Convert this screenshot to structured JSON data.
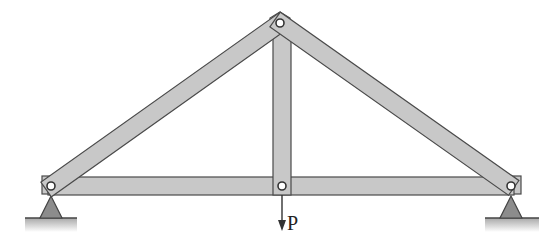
{
  "diagram": {
    "type": "truss",
    "colors": {
      "member_fill": "#c8c8c8",
      "member_stroke": "#4a4a4a",
      "support_fill": "#8c8c8c",
      "ground": "#bdbdbd"
    },
    "joints": [
      {
        "id": "left-support-joint",
        "x": 51,
        "y": 186
      },
      {
        "id": "apex-joint",
        "x": 280,
        "y": 23
      },
      {
        "id": "bottom-center-joint",
        "x": 282,
        "y": 186
      },
      {
        "id": "right-support-joint",
        "x": 511,
        "y": 186
      }
    ],
    "members": [
      {
        "id": "bottom-chord",
        "from": "left-support-joint",
        "to": "right-support-joint"
      },
      {
        "id": "left-rafter",
        "from": "left-support-joint",
        "to": "apex-joint"
      },
      {
        "id": "right-rafter",
        "from": "apex-joint",
        "to": "right-support-joint"
      },
      {
        "id": "king-post",
        "from": "apex-joint",
        "to": "bottom-center-joint"
      }
    ],
    "supports": [
      {
        "id": "left-support",
        "type": "pin"
      },
      {
        "id": "right-support",
        "type": "pin"
      }
    ],
    "load": {
      "label": "P",
      "direction": "down",
      "at": "bottom-center-joint"
    }
  }
}
